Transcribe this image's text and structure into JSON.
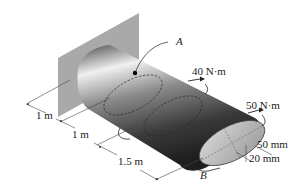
{
  "figure": {
    "type": "shaft-torsion-diagram",
    "point_labels": {
      "a": "A",
      "b": "B"
    },
    "torques": [
      {
        "label": "40 N·m"
      },
      {
        "label": "50 N·m"
      }
    ],
    "lengths": [
      {
        "label": "1 m"
      },
      {
        "label": "1 m"
      },
      {
        "label": "1.5 m"
      }
    ],
    "cross_section": {
      "semi_major": "50 mm",
      "semi_minor": "20 mm"
    },
    "colors": {
      "wall": "#a8a8a8",
      "shaft_dark": "#2a2a2a",
      "shaft_light": "#e8e8e8",
      "line": "#333333"
    }
  }
}
